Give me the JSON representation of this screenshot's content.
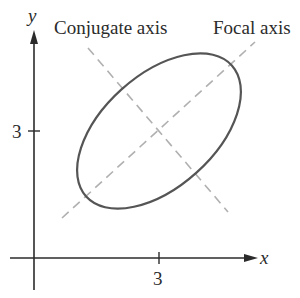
{
  "diagram": {
    "type": "ellipse-with-axes",
    "labels": {
      "conjugate_axis": "Conjugate axis",
      "focal_axis": "Focal axis",
      "x_axis": "x",
      "y_axis": "y",
      "x_tick": "3",
      "y_tick": "3"
    },
    "ellipse": {
      "center": [
        3,
        3
      ],
      "rotation_deg": -42
    },
    "colors": {
      "axes": "#2b2b2b",
      "ellipse": "#555555",
      "dashed": "#b0b0b0"
    }
  }
}
